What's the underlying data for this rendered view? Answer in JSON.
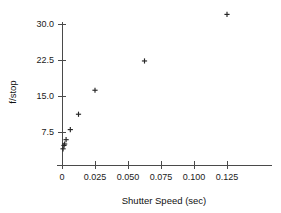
{
  "chart_data": {
    "type": "scatter",
    "title": "",
    "xlabel": "Shutter Speed (sec)",
    "ylabel": "f/stop",
    "xlim": [
      -0.006,
      0.145
    ],
    "ylim": [
      0.0,
      33.5
    ],
    "grid": false,
    "legend": null,
    "marker": "plus",
    "marker_color": "#262626",
    "axis_color": "#4a4a4a",
    "xticks": [
      0,
      0.025,
      0.05,
      0.075,
      0.1,
      0.125
    ],
    "xtick_labels": [
      "0",
      "0.025",
      "0.050",
      "0.075",
      "0.100",
      "0.125"
    ],
    "yticks": [
      7.5,
      15.0,
      22.5,
      30.0
    ],
    "ytick_labels": [
      "7.5",
      "15.0",
      "22.5",
      "30.0"
    ],
    "x": [
      0.0008,
      0.0015,
      0.002,
      0.0031,
      0.0063,
      0.0125,
      0.025,
      0.0625,
      0.125
    ],
    "y": [
      4.0,
      4.7,
      5.0,
      5.9,
      8.0,
      11.2,
      16.2,
      22.3,
      32.0
    ],
    "points": [
      {
        "x": 0.0008,
        "y": 4.0
      },
      {
        "x": 0.0015,
        "y": 4.7
      },
      {
        "x": 0.002,
        "y": 5.0
      },
      {
        "x": 0.0031,
        "y": 5.9
      },
      {
        "x": 0.0063,
        "y": 8.0
      },
      {
        "x": 0.0125,
        "y": 11.2
      },
      {
        "x": 0.025,
        "y": 16.2
      },
      {
        "x": 0.0625,
        "y": 22.3
      },
      {
        "x": 0.125,
        "y": 32.0
      }
    ]
  },
  "labels": {
    "x_axis_title": "Shutter Speed (sec)",
    "y_axis_title": "f/stop"
  }
}
